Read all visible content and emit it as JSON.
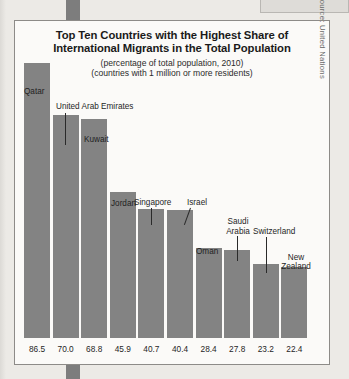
{
  "chart_data": {
    "type": "bar",
    "title": "Top Ten Countries with the Highest Share of International Migrants in the Total Population",
    "title_line1": "Top Ten Countries with the Highest Share of",
    "title_line2": "International Migrants in the Total Population",
    "subtitle1": "(percentage of total population, 2010)",
    "subtitle2": "(countries with 1 million or more residents)",
    "xlabel": "",
    "ylabel": "",
    "ylim": [
      0,
      86.5
    ],
    "grid": false,
    "legend": false,
    "bar_color": "#838383",
    "categories": [
      "Qatar",
      "United Arab Emirates",
      "Kuwait",
      "Jordan",
      "Singapore",
      "Israel",
      "Oman",
      "Saudi Arabia",
      "Switzerland",
      "New Zealand"
    ],
    "values": [
      86.5,
      70.0,
      68.8,
      45.9,
      40.7,
      40.4,
      28.4,
      27.8,
      23.2,
      22.4
    ],
    "value_labels": [
      "86.5",
      "70.0",
      "68.8",
      "45.9",
      "40.7",
      "40.4",
      "28.4",
      "27.8",
      "23.2",
      "22.4"
    ],
    "source": "Source: United Nations"
  },
  "bars": [
    {
      "name": "Qatar",
      "value_label": "86.5"
    },
    {
      "name": "United Arab Emirates",
      "value_label": "70.0"
    },
    {
      "name": "Kuwait",
      "value_label": "68.8"
    },
    {
      "name": "Jordan",
      "value_label": "45.9"
    },
    {
      "name": "Singapore",
      "value_label": "40.7"
    },
    {
      "name": "Israel",
      "value_label": "40.4"
    },
    {
      "name": "Oman",
      "value_label": "28.4"
    },
    {
      "name": "Saudi Arabia",
      "value_label": "27.8"
    },
    {
      "name": "Switzerland",
      "value_label": "23.2"
    },
    {
      "name": "New Zealand",
      "value_label": "22.4"
    }
  ],
  "labels": {
    "qatar": "Qatar",
    "uae": "United Arab Emirates",
    "kuwait": "Kuwait",
    "jordan": "Jordan",
    "singapore": "Singapore",
    "israel": "Israel",
    "oman": "Oman",
    "saudi_arabia_line1": "Saudi",
    "saudi_arabia_line2": "Arabia",
    "switzerland": "Switzerland",
    "new_zealand_line1": "New",
    "new_zealand_line2": "Zealand"
  }
}
